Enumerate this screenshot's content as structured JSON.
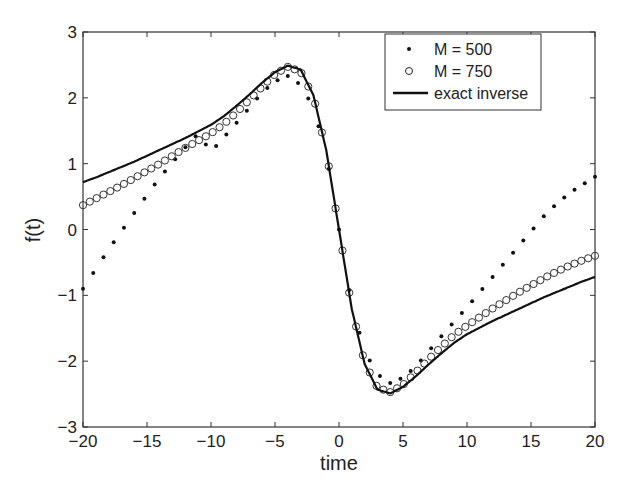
{
  "chart_data": {
    "type": "line",
    "title": "",
    "xlabel": "time",
    "ylabel": "f(t)",
    "xlim": [
      -20,
      20
    ],
    "ylim": [
      -3,
      3
    ],
    "xticks": [
      -20,
      -15,
      -10,
      -5,
      0,
      5,
      10,
      15,
      20
    ],
    "yticks": [
      -3,
      -2,
      -1,
      0,
      1,
      2,
      3
    ],
    "grid": false,
    "legend_position": "upper right",
    "x": [
      -20,
      -19,
      -18,
      -17,
      -16,
      -15,
      -14,
      -13,
      -12,
      -11,
      -10,
      -9,
      -8,
      -7,
      -6,
      -5,
      -4,
      -3,
      -2,
      -1,
      0,
      1,
      2,
      3,
      4,
      5,
      6,
      7,
      8,
      9,
      10,
      11,
      12,
      13,
      14,
      15,
      16,
      17,
      18,
      19,
      20
    ],
    "series": [
      {
        "name": "M = 500",
        "marker": "dot",
        "values": [
          -0.9,
          -0.6,
          -0.3,
          -0.03,
          0.25,
          0.52,
          0.79,
          1.02,
          1.25,
          1.46,
          1.18,
          1.4,
          1.62,
          1.85,
          2.08,
          2.25,
          2.33,
          2.2,
          1.85,
          1.15,
          0,
          -1.15,
          -1.85,
          -2.2,
          -2.33,
          -2.25,
          -2.08,
          -1.85,
          -1.62,
          -1.4,
          -1.18,
          -0.95,
          -0.72,
          -0.49,
          -0.26,
          -0.03,
          0.2,
          0.39,
          0.55,
          0.68,
          0.8
        ]
      },
      {
        "name": "M = 750",
        "marker": "circle",
        "values": [
          0.37,
          0.47,
          0.57,
          0.67,
          0.78,
          0.89,
          1.0,
          1.12,
          1.24,
          1.35,
          1.46,
          1.6,
          1.78,
          1.97,
          2.17,
          2.36,
          2.47,
          2.4,
          2.02,
          1.2,
          0,
          -1.2,
          -2.02,
          -2.4,
          -2.47,
          -2.36,
          -2.17,
          -1.97,
          -1.78,
          -1.6,
          -1.46,
          -1.33,
          -1.2,
          -1.08,
          -0.96,
          -0.85,
          -0.74,
          -0.64,
          -0.55,
          -0.47,
          -0.4
        ]
      },
      {
        "name": "exact inverse",
        "marker": "line",
        "values": [
          0.72,
          0.79,
          0.87,
          0.95,
          1.03,
          1.12,
          1.21,
          1.3,
          1.39,
          1.49,
          1.59,
          1.72,
          1.88,
          2.05,
          2.23,
          2.39,
          2.49,
          2.43,
          2.04,
          1.21,
          0,
          -1.21,
          -2.04,
          -2.43,
          -2.49,
          -2.39,
          -2.23,
          -2.05,
          -1.88,
          -1.72,
          -1.59,
          -1.49,
          -1.39,
          -1.3,
          -1.21,
          -1.12,
          -1.03,
          -0.95,
          -0.87,
          -0.79,
          -0.72
        ]
      }
    ]
  }
}
